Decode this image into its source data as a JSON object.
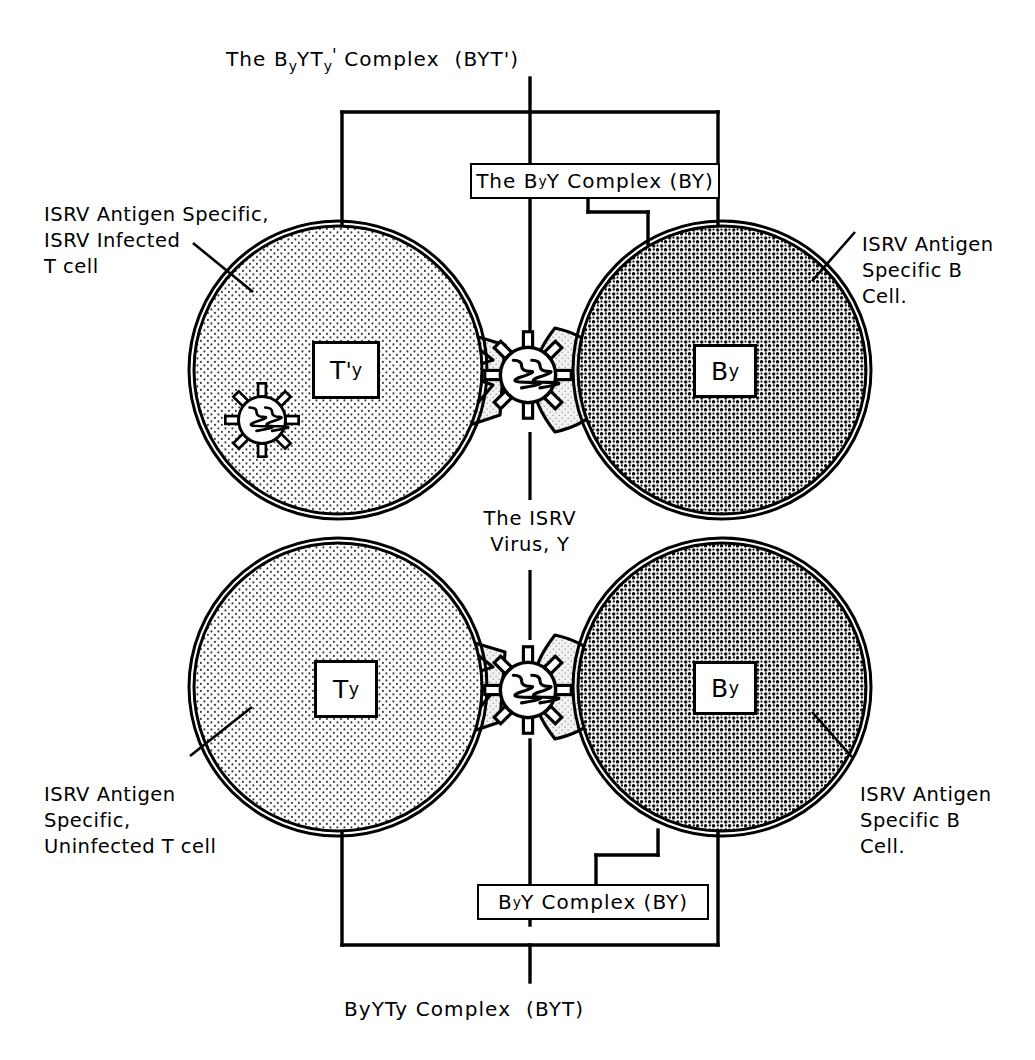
{
  "figure": {
    "kind": "immunology-schematic",
    "top_title": {
      "pre": "The B",
      "sub1": "y",
      "mid": "YT",
      "sub2": "y",
      "prime": "'",
      "post": " Complex  (BYT')",
      "plain": "The ByYTy' Complex  (BYT')"
    },
    "bottom_title": {
      "plain": "ByYTy Complex  (BYT)"
    },
    "top_box": {
      "pre": "The B",
      "sub1": "y",
      "post": "Y Complex (BY)",
      "plain": "The ByY Complex (BY)"
    },
    "bottom_box": {
      "pre": "B",
      "sub1": "y",
      "post": " Y Complex (BY)",
      "plain": "ByY Complex (BY)"
    },
    "center_label": {
      "line1": "The ISRV",
      "line2": "Virus, Y"
    }
  },
  "annotations": {
    "top_left": {
      "line1": "ISRV Antigen Specific,",
      "line2": "ISRV Infected",
      "line3": "T cell"
    },
    "top_right": {
      "line1": "ISRV Antigen",
      "line2": "Specific B",
      "line3": "Cell."
    },
    "bottom_left": {
      "line1": "ISRV Antigen",
      "line2": "Specific,",
      "line3": "Uninfected T cell"
    },
    "bottom_right": {
      "line1": "ISRV Antigen",
      "line2": "Specific B",
      "line3": "Cell."
    }
  },
  "cells": {
    "top_left_tag": {
      "base": "T",
      "prime": "'",
      "sub": "y",
      "plain": "T'y"
    },
    "top_right_tag": {
      "base": "B",
      "sub": "y",
      "plain": "By"
    },
    "bottom_left_tag": {
      "base": "T",
      "sub": "y",
      "plain": "Ty"
    },
    "bottom_right_tag": {
      "base": "B",
      "sub": "y",
      "plain": "By"
    }
  },
  "icons": {
    "virus_particle": "virus-icon",
    "t_cell": "t-cell-icon",
    "b_cell": "b-cell-icon",
    "receptor_left": "t-cell-receptor-icon",
    "receptor_right": "antibody-receptor-icon"
  },
  "colors": {
    "ink": "#000000",
    "background": "#ffffff",
    "t_cell_fill": "#e9e9e9",
    "b_cell_fill": "#dcdcdc",
    "receptor_fill": "#e2e2e2"
  }
}
